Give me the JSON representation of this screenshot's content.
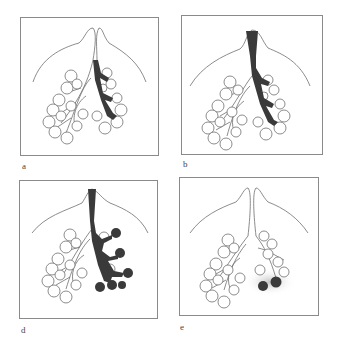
{
  "figure": {
    "panels": [
      {
        "id": "a",
        "label": "a",
        "shaded": "right-lower-bronchus"
      },
      {
        "id": "b",
        "label": "b",
        "shaded": "trachea-and-right-bronchus"
      },
      {
        "id": "d",
        "label": "d",
        "shaded": "trachea-bronchus-and-terminal-alveoli"
      },
      {
        "id": "e",
        "label": "e",
        "shaded": "two-alveolar-clusters-with-halo"
      }
    ],
    "colors": {
      "outline": "#6f6f6f",
      "shade": "#3a3a3a",
      "frame": "#8a8a8a",
      "halo": "#bdbdbd"
    }
  }
}
